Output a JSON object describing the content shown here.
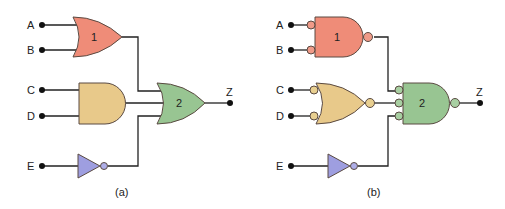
{
  "colors": {
    "gate1": "#ef8c78",
    "gate_and_or": "#e8c98a",
    "gate2": "#98c592",
    "not_gate": "#9e9ee0",
    "bubble_gate1": "#ef9a88",
    "bubble_mid": "#e8cf90",
    "bubble_gate2": "#a8cfa2",
    "bubble_not": "#aeaee8"
  },
  "panels": [
    {
      "caption": "(a)",
      "inputs": [
        "A",
        "B",
        "C",
        "D",
        "E"
      ],
      "output": "Z",
      "gate1_label": "1",
      "gate2_label": "2"
    },
    {
      "caption": "(b)",
      "inputs": [
        "A",
        "B",
        "C",
        "D",
        "E"
      ],
      "output": "Z",
      "gate1_label": "1",
      "gate2_label": "2"
    }
  ]
}
